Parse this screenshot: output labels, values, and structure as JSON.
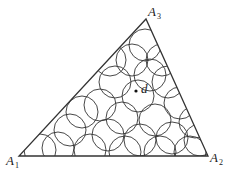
{
  "diagram": {
    "type": "triangle-covered-by-circles",
    "vertices": [
      {
        "name": "A",
        "subscript": "1",
        "x": 19,
        "y": 156
      },
      {
        "name": "A",
        "subscript": "2",
        "x": 208,
        "y": 156
      },
      {
        "name": "A",
        "subscript": "3",
        "x": 146,
        "y": 19
      }
    ],
    "point": {
      "label": "d",
      "x": 136,
      "y": 91
    },
    "stroke_color": "#333333",
    "circle_radius": 16,
    "circle_centers": [
      [
        132,
        60
      ],
      [
        162,
        60
      ],
      [
        115,
        82
      ],
      [
        168,
        82
      ],
      [
        100,
        105
      ],
      [
        138,
        96
      ],
      [
        180,
        103
      ],
      [
        82,
        112
      ],
      [
        122,
        118
      ],
      [
        155,
        120
      ],
      [
        195,
        122
      ],
      [
        70,
        130
      ],
      [
        108,
        135
      ],
      [
        140,
        140
      ],
      [
        172,
        138
      ],
      [
        200,
        140
      ],
      [
        58,
        148
      ],
      [
        90,
        150
      ],
      [
        125,
        152
      ],
      [
        160,
        152
      ],
      [
        190,
        152
      ],
      [
        40,
        150
      ],
      [
        145,
        45
      ],
      [
        150,
        75
      ],
      [
        110,
        60
      ]
    ]
  }
}
